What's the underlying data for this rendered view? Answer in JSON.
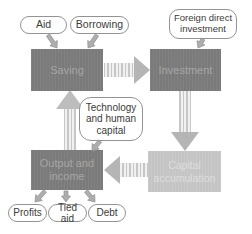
{
  "diagram": {
    "nodes": {
      "saving": {
        "label": "Saving"
      },
      "investment": {
        "label": "Investment"
      },
      "output_income": {
        "label": "Output and income"
      },
      "capital_accumulation": {
        "label": "Capital accumulation"
      }
    },
    "pills": {
      "aid": {
        "label": "Aid"
      },
      "borrowing": {
        "label": "Borrowing"
      },
      "foreign_direct_investment": {
        "label": "Foreign direct investment"
      },
      "technology_human_capital": {
        "label": "Technology and human capital"
      },
      "profits": {
        "label": "Profits"
      },
      "tied_aid": {
        "label": "Tied aid"
      },
      "debt": {
        "label": "Debt"
      }
    },
    "flows": [
      "Aid -> Saving",
      "Borrowing -> Saving",
      "Foreign direct investment -> Investment",
      "Saving -> Investment",
      "Investment -> Capital accumulation",
      "Capital accumulation -> Output and income",
      "Technology and human capital -> Output and income",
      "Output and income -> Saving",
      "Output and income -> Profits",
      "Output and income -> Tied aid",
      "Output and income -> Debt"
    ],
    "colors": {
      "dark_box": "#7a7a7a",
      "dark_box_text": "#a6a6a6",
      "light_box": "#c4c4c4",
      "light_box_text": "#dedede",
      "pill_border": "#939393",
      "pill_text": "#3b3b3b",
      "arrow_head": "#b5b5b5",
      "arrow_stripe": "#c7c7c7",
      "connector_arrow": "#adadad",
      "background": "#ffffff"
    }
  }
}
